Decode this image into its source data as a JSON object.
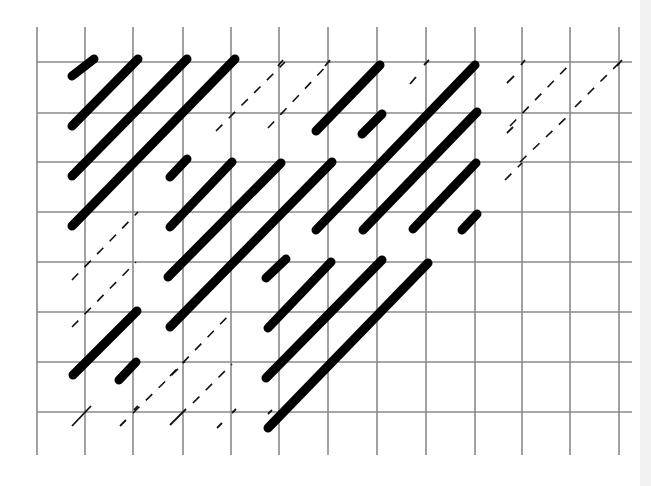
{
  "diagram": {
    "type": "grid-with-diagonal-strokes",
    "background": "#ffffff",
    "grid_color": "#8a8a8a",
    "stroke_color": "#000000",
    "grid": {
      "columns_x": [
        37,
        85,
        133,
        183,
        231,
        279,
        328,
        377,
        426,
        475,
        522,
        570,
        619
      ],
      "rows_y": [
        62,
        113,
        162,
        212,
        262,
        312,
        362,
        412
      ],
      "vertical_top": 27,
      "vertical_bottom": 455,
      "horizontal_left": 37,
      "horizontal_right": 632
    },
    "thick_strokes": [
      [
        72,
        76,
        94,
        59
      ],
      [
        72,
        126,
        138,
        59
      ],
      [
        72,
        176,
        187,
        59
      ],
      [
        72,
        226,
        235,
        59
      ],
      [
        170,
        177,
        187,
        159
      ],
      [
        170,
        227,
        232,
        162
      ],
      [
        168,
        277,
        281,
        163
      ],
      [
        170,
        327,
        332,
        162
      ],
      [
        316,
        131,
        380,
        65
      ],
      [
        362,
        134,
        382,
        114
      ],
      [
        316,
        230,
        475,
        65
      ],
      [
        363,
        230,
        477,
        112
      ],
      [
        413,
        229,
        476,
        163
      ],
      [
        462,
        230,
        477,
        214
      ],
      [
        266,
        278,
        286,
        259
      ],
      [
        268,
        328,
        331,
        262
      ],
      [
        266,
        378,
        382,
        260
      ],
      [
        268,
        428,
        428,
        263
      ],
      [
        73,
        375,
        137,
        311
      ],
      [
        119,
        380,
        136,
        362
      ]
    ],
    "dashed_strokes": [
      [
        216,
        131,
        285,
        62
      ],
      [
        268,
        128,
        330,
        62
      ],
      [
        72,
        280,
        138,
        212
      ],
      [
        72,
        327,
        136,
        262
      ],
      [
        133,
        413,
        185,
        362
      ],
      [
        170,
        376,
        232,
        312
      ],
      [
        193,
        403,
        232,
        364
      ],
      [
        510,
        126,
        572,
        62
      ],
      [
        575,
        107,
        620,
        62
      ],
      [
        520,
        162,
        572,
        112
      ],
      [
        505,
        180,
        522,
        163
      ]
    ],
    "short_ticks": [
      [
        278,
        66,
        283,
        60
      ],
      [
        325,
        66,
        330,
        60
      ],
      [
        410,
        84,
        416,
        77
      ],
      [
        424,
        65,
        429,
        60
      ],
      [
        507,
        83,
        514,
        76
      ],
      [
        521,
        65,
        525,
        60
      ],
      [
        617,
        66,
        622,
        60
      ],
      [
        507,
        133,
        513,
        127
      ],
      [
        359,
        82,
        364,
        77
      ],
      [
        72,
        426,
        91,
        406
      ],
      [
        120,
        426,
        126,
        420
      ],
      [
        134,
        410,
        138,
        406
      ],
      [
        170,
        425,
        186,
        409
      ],
      [
        217,
        428,
        222,
        423
      ],
      [
        232,
        413,
        236,
        409
      ],
      [
        268,
        414,
        272,
        410
      ]
    ]
  }
}
